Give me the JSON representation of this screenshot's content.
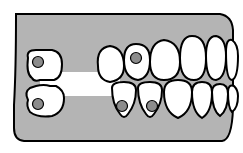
{
  "diagram": {
    "title": "",
    "colors": {
      "gum": "#b4b4b4",
      "tooth": "#ffffff",
      "outline": "#000000",
      "implant": "#8c8c8c",
      "background": "#ffffff"
    },
    "gum_shape": "M16,14 L220,14 Q232,16 233,30 L233,108 Q232,140 222,141 L24,141 Q14,140 14,128 Q14,108 14,105 Q16,70 16,14 Z",
    "mouth_gap": {
      "x": 40,
      "y": 72,
      "w": 80,
      "h": 24
    },
    "upper_teeth": [
      {
        "id": "u-left-molar",
        "d": "M28,58 Q26,50 36,50 L52,50 Q62,52 62,64 Q62,78 54,80 L40,80 Q34,82 32,78 Q26,74 28,58 Z",
        "implant": true,
        "cx": 38,
        "cy": 62
      },
      {
        "id": "u1",
        "d": "M98,66 Q96,48 110,46 Q124,48 124,66 Q124,80 110,82 Q98,80 98,66 Z",
        "implant": false
      },
      {
        "id": "u2",
        "d": "M124,60 Q124,44 136,44 Q150,44 150,60 Q150,78 138,80 Q124,78 124,60 Z",
        "implant": true,
        "cx": 136,
        "cy": 58
      },
      {
        "id": "u3",
        "d": "M150,62 Q150,42 164,40 Q180,42 180,62 Q180,80 164,80 Q150,80 150,62 Z",
        "implant": false
      },
      {
        "id": "u4",
        "d": "M180,58 Q180,36 192,36 Q206,36 206,58 Q206,80 194,80 Q180,80 180,58 Z",
        "implant": false
      },
      {
        "id": "u5",
        "d": "M206,56 Q206,36 216,36 Q226,38 226,56 Q226,78 216,80 Q206,80 206,56 Z",
        "implant": false
      },
      {
        "id": "u6",
        "d": "M226,52 Q226,38 232,40 Q238,44 238,56 Q238,78 232,80 Q226,80 226,52 Z",
        "implant": false
      }
    ],
    "lower_teeth": [
      {
        "id": "l-left-molar",
        "d": "M28,100 Q24,92 30,88 L36,86 Q44,84 50,86 L56,86 Q64,90 64,98 Q64,112 52,116 Q38,118 30,112 Q26,106 28,100 Z",
        "implant": true,
        "cx": 38,
        "cy": 104
      },
      {
        "id": "l1",
        "d": "M112,88 Q112,82 124,82 Q136,82 136,90 Q136,104 128,114 Q124,120 120,114 Q112,104 112,88 Z",
        "implant": true,
        "cx": 122,
        "cy": 106
      },
      {
        "id": "l2",
        "d": "M138,88 Q138,82 150,82 Q162,82 162,90 Q162,104 154,114 Q150,120 146,114 Q138,104 138,88 Z",
        "implant": true,
        "cx": 152,
        "cy": 106
      },
      {
        "id": "l3",
        "d": "M164,92 Q164,80 178,80 Q192,80 192,92 Q192,112 178,118 Q164,112 164,92 Z",
        "implant": false
      },
      {
        "id": "l4",
        "d": "M192,92 Q192,82 202,82 Q212,82 212,92 Q212,112 202,118 Q192,112 192,92 Z",
        "implant": false
      },
      {
        "id": "l5",
        "d": "M212,92 Q212,84 220,84 Q228,84 228,94 Q228,110 220,116 Q212,110 212,92 Z",
        "implant": false
      },
      {
        "id": "l6",
        "d": "M228,92 Q228,84 234,86 Q238,90 238,96 Q238,108 232,112 Q228,108 228,92 Z",
        "implant": false
      }
    ],
    "implant_radius": 5.5
  }
}
